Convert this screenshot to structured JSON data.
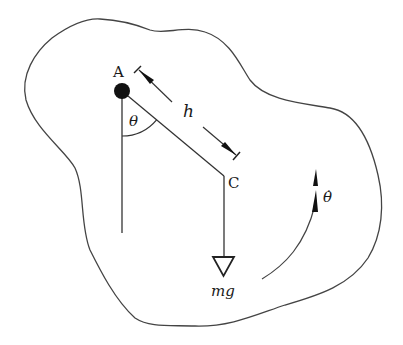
{
  "diagram": {
    "type": "physical-pendulum-free-body",
    "labels": {
      "pivot": "A",
      "center_of_mass": "C",
      "distance": "h",
      "angle": "θ",
      "weight": "mg",
      "angular_velocity": "θ̇"
    },
    "colors": {
      "stroke": "#333333",
      "fill_dark": "#111111",
      "background": "#ffffff"
    }
  }
}
